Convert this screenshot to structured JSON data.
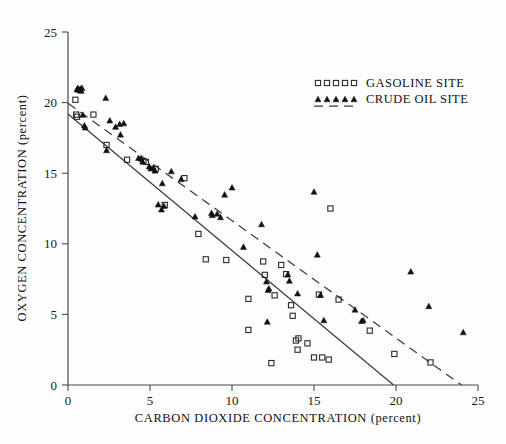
{
  "chart_data": {
    "type": "scatter",
    "title": "",
    "xlabel": "CARBON DIOXIDE CONCENTRATION (percent)",
    "ylabel": "OXYGEN CONCENTRATION (percent)",
    "xlim": [
      0,
      25
    ],
    "ylim": [
      0,
      25
    ],
    "xticks": [
      0,
      5,
      10,
      15,
      20,
      25
    ],
    "yticks": [
      0,
      5,
      10,
      15,
      20,
      25
    ],
    "xtick_labels": [
      "0",
      "5",
      "10",
      "15",
      "20",
      "25"
    ],
    "ytick_labels": [
      "0",
      "5",
      "10",
      "15",
      "20",
      "25"
    ],
    "grid": false,
    "legend_position": "top-right",
    "series": [
      {
        "name": "GASOLINE SITE",
        "marker": "open-square",
        "fit_line_style": "solid",
        "points": [
          [
            0.45,
            20.2
          ],
          [
            0.5,
            19.15
          ],
          [
            0.55,
            19.0
          ],
          [
            1.55,
            19.15
          ],
          [
            2.35,
            17.0
          ],
          [
            3.6,
            15.95
          ],
          [
            4.6,
            15.85
          ],
          [
            4.75,
            15.8
          ],
          [
            5.35,
            15.3
          ],
          [
            5.9,
            12.75
          ],
          [
            7.1,
            14.65
          ],
          [
            7.95,
            10.7
          ],
          [
            8.4,
            8.9
          ],
          [
            9.65,
            8.85
          ],
          [
            11.0,
            6.1
          ],
          [
            11.0,
            3.9
          ],
          [
            11.9,
            8.75
          ],
          [
            12.0,
            7.8
          ],
          [
            12.4,
            1.55
          ],
          [
            12.6,
            6.35
          ],
          [
            13.0,
            8.5
          ],
          [
            13.3,
            7.85
          ],
          [
            13.6,
            5.65
          ],
          [
            13.7,
            4.9
          ],
          [
            13.9,
            3.15
          ],
          [
            14.0,
            2.5
          ],
          [
            14.05,
            3.3
          ],
          [
            14.6,
            2.95
          ],
          [
            15.0,
            1.95
          ],
          [
            15.3,
            6.4
          ],
          [
            15.5,
            1.95
          ],
          [
            15.9,
            1.8
          ],
          [
            16.0,
            12.5
          ],
          [
            16.5,
            6.05
          ],
          [
            18.4,
            3.85
          ],
          [
            19.9,
            2.2
          ],
          [
            22.1,
            1.6
          ]
        ]
      },
      {
        "name": "CRUDE OIL SITE",
        "marker": "filled-triangle",
        "fit_line_style": "dashed",
        "points": [
          [
            0.55,
            20.95
          ],
          [
            0.6,
            21.05
          ],
          [
            0.7,
            20.9
          ],
          [
            0.75,
            21.0
          ],
          [
            0.8,
            20.85
          ],
          [
            0.85,
            21.05
          ],
          [
            0.9,
            19.15
          ],
          [
            1.0,
            18.4
          ],
          [
            1.05,
            18.25
          ],
          [
            2.3,
            20.35
          ],
          [
            2.35,
            16.65
          ],
          [
            2.55,
            18.75
          ],
          [
            2.9,
            18.3
          ],
          [
            3.15,
            18.5
          ],
          [
            3.2,
            17.75
          ],
          [
            3.4,
            18.55
          ],
          [
            4.3,
            16.1
          ],
          [
            4.45,
            16.05
          ],
          [
            4.55,
            15.85
          ],
          [
            4.95,
            15.5
          ],
          [
            5.05,
            15.35
          ],
          [
            5.2,
            15.4
          ],
          [
            5.3,
            15.2
          ],
          [
            5.5,
            12.8
          ],
          [
            5.7,
            12.45
          ],
          [
            5.75,
            14.3
          ],
          [
            5.85,
            12.7
          ],
          [
            6.3,
            15.15
          ],
          [
            6.9,
            14.6
          ],
          [
            7.75,
            11.95
          ],
          [
            8.75,
            12.2
          ],
          [
            8.8,
            12.05
          ],
          [
            9.1,
            12.15
          ],
          [
            9.3,
            11.9
          ],
          [
            9.55,
            13.5
          ],
          [
            10.0,
            14.0
          ],
          [
            10.7,
            9.8
          ],
          [
            11.8,
            11.4
          ],
          [
            12.1,
            7.35
          ],
          [
            12.15,
            4.5
          ],
          [
            12.2,
            6.75
          ],
          [
            12.25,
            6.85
          ],
          [
            13.4,
            7.85
          ],
          [
            13.5,
            7.4
          ],
          [
            14.0,
            6.5
          ],
          [
            15.0,
            13.7
          ],
          [
            15.2,
            9.25
          ],
          [
            15.4,
            6.4
          ],
          [
            15.6,
            4.6
          ],
          [
            17.5,
            5.35
          ],
          [
            17.9,
            4.55
          ],
          [
            18.0,
            4.6
          ],
          [
            20.9,
            8.05
          ],
          [
            22.0,
            5.6
          ],
          [
            24.1,
            3.75
          ]
        ]
      }
    ],
    "fit_lines": [
      {
        "name": "gasoline-fit",
        "style": "solid",
        "x0": 0.0,
        "y0": 19.2,
        "x1": 19.85,
        "y1": 0.0
      },
      {
        "name": "crude-oil-fit",
        "style": "dashed",
        "x0": 0.0,
        "y0": 19.95,
        "x1": 24.0,
        "y1": 0.0
      }
    ]
  },
  "legend": {
    "entries": [
      {
        "label": "GASOLINE SITE",
        "marker": "open-square",
        "line": "none"
      },
      {
        "label": "CRUDE OIL SITE",
        "marker": "filled-triangle",
        "line": "dashed"
      }
    ]
  }
}
